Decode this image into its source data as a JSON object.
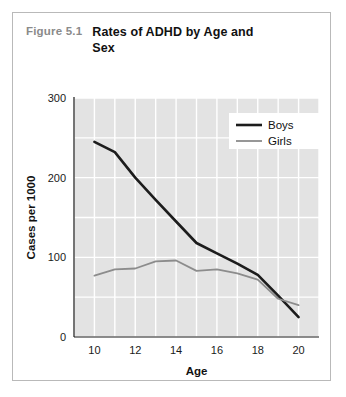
{
  "figure": {
    "number": "Figure 5.1",
    "title": "Rates of ADHD by Age and Sex"
  },
  "colors": {
    "plot_background": "#e3e3e3",
    "gridline": "#ffffff",
    "axis": "#1a1a1a",
    "boys_line": "#1c1c1c",
    "girls_line": "#8c8c8c",
    "figure_number_text": "#8a8a8a",
    "title_text": "#111111",
    "card_border": "#b9b9b9"
  },
  "legend": {
    "position": "top-right",
    "entries": [
      {
        "label": "Boys",
        "color": "#1c1c1c",
        "width": 2.6
      },
      {
        "label": "Girls",
        "color": "#8c8c8c",
        "width": 1.8
      }
    ]
  },
  "chart_data": {
    "type": "line",
    "title": "Rates of ADHD by Age and Sex",
    "xlabel": "Age",
    "ylabel": "Cases per 1000",
    "xlim": [
      9,
      21
    ],
    "ylim": [
      0,
      300
    ],
    "xticks": [
      10,
      12,
      14,
      16,
      18,
      20
    ],
    "yticks": [
      0,
      100,
      200,
      300
    ],
    "xgrid_step": 1,
    "ygrid_step": 50,
    "grid": true,
    "x": [
      10,
      11,
      12,
      13,
      14,
      15,
      16,
      17,
      18,
      19,
      20
    ],
    "series": [
      {
        "name": "Boys",
        "color": "#1c1c1c",
        "width": 2.6,
        "values": [
          245,
          232,
          200,
          172,
          145,
          118,
          105,
          92,
          78,
          52,
          25
        ]
      },
      {
        "name": "Girls",
        "color": "#8c8c8c",
        "width": 1.8,
        "values": [
          77,
          85,
          86,
          95,
          96,
          83,
          85,
          80,
          72,
          48,
          40
        ]
      }
    ]
  }
}
